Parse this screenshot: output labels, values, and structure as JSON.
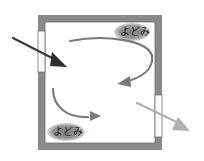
{
  "diagram": {
    "type": "room-airflow",
    "stagnation_label_top": "よどみ",
    "stagnation_label_bottom": "よどみ",
    "colors": {
      "wall": "#8a8a8a",
      "wall_edge": "#6e6e6e",
      "inflow_arrow": "#3a3a3a",
      "circulation_arrow": "#777777",
      "outflow_arrow": "#b0b0b0",
      "stagnation_blob": "#8c8c8c"
    }
  }
}
